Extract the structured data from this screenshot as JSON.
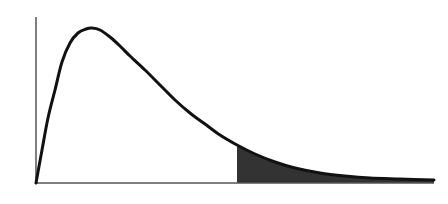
{
  "chart_data": {
    "type": "area",
    "title": "",
    "xlabel": "",
    "ylabel": "",
    "x": [
      0.0,
      0.1,
      0.2,
      0.3,
      0.4,
      0.5,
      0.6,
      0.7,
      0.8,
      0.9,
      1.0
    ],
    "series": [
      {
        "name": "density",
        "values": [
          0.0,
          0.85,
          0.92,
          0.76,
          0.55,
          0.36,
          0.22,
          0.12,
          0.06,
          0.03,
          0.01
        ]
      }
    ],
    "shaded_region": {
      "from": 0.5,
      "to": 1.0,
      "label": "right-tail area"
    },
    "axes": {
      "x_ticks": [],
      "y_ticks": [],
      "grid": false
    },
    "colors": {
      "curve": "#111111",
      "fill": "#333333",
      "axis": "#555555"
    }
  },
  "pixel_geometry": {
    "origin": [
      36,
      183
    ],
    "y_axis_top": 17,
    "x_axis_end": 434,
    "curve_points": [
      [
        36,
        183
      ],
      [
        42,
        150
      ],
      [
        48,
        118
      ],
      [
        55,
        90
      ],
      [
        62,
        62
      ],
      [
        70,
        43
      ],
      [
        78,
        33
      ],
      [
        86,
        29
      ],
      [
        92,
        28
      ],
      [
        100,
        30
      ],
      [
        110,
        37
      ],
      [
        120,
        46
      ],
      [
        130,
        56
      ],
      [
        145,
        70
      ],
      [
        160,
        85
      ],
      [
        175,
        100
      ],
      [
        190,
        113
      ],
      [
        205,
        124
      ],
      [
        220,
        135
      ],
      [
        237,
        145
      ],
      [
        255,
        154
      ],
      [
        275,
        162
      ],
      [
        295,
        168
      ],
      [
        320,
        173
      ],
      [
        345,
        176
      ],
      [
        370,
        178
      ],
      [
        400,
        179
      ],
      [
        434,
        180
      ]
    ],
    "shade_start_x": 237
  }
}
